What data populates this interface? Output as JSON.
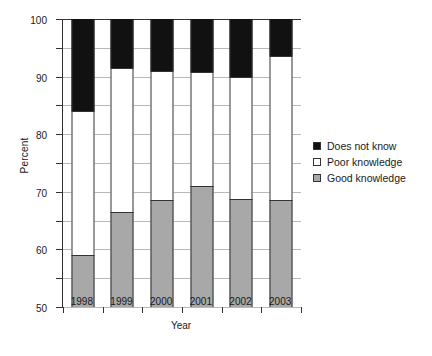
{
  "chart_data": {
    "type": "bar",
    "subtype": "stacked-bar-100",
    "title": "",
    "xlabel": "Year",
    "ylabel": "Percent",
    "categories": [
      "1998",
      "1999",
      "2000",
      "2001",
      "2002",
      "2003"
    ],
    "ylim": [
      0,
      100
    ],
    "yticks": [
      0,
      10,
      20,
      30,
      40,
      50,
      60,
      70,
      80,
      90,
      100
    ],
    "ytick_labels": [
      "0",
      "10",
      "20",
      "30",
      "40",
      "50",
      "60",
      "70",
      "80",
      "90",
      "100"
    ],
    "grid": true,
    "grid_axis": "y",
    "legend_position": "right",
    "stack_order_bottom_to_top": [
      "Good knowledge",
      "Poor knowledge",
      "Does not know"
    ],
    "series": [
      {
        "name": "Good knowledge",
        "color": "#a8a8a8",
        "values": [
          18,
          33,
          37,
          42,
          37.5,
          37
        ]
      },
      {
        "name": "Poor knowledge",
        "color": "#ffffff",
        "values": [
          50,
          50,
          45,
          39.5,
          42.5,
          50
        ]
      },
      {
        "name": "Does not know",
        "color": "#111111",
        "values": [
          32,
          17,
          18,
          18.5,
          20,
          13
        ]
      }
    ],
    "cumulative_tops": {
      "good_knowledge": [
        18,
        33,
        37,
        42,
        37.5,
        37
      ],
      "poor_knowledge": [
        68,
        83,
        82,
        81.5,
        80,
        87
      ],
      "does_not_know": [
        100,
        100,
        100,
        100,
        100,
        100
      ]
    }
  },
  "legend": {
    "items": [
      {
        "label": "Does not know",
        "color": "#111111"
      },
      {
        "label": "Poor knowledge",
        "color": "#ffffff"
      },
      {
        "label": "Good knowledge",
        "color": "#a8a8a8"
      }
    ]
  }
}
